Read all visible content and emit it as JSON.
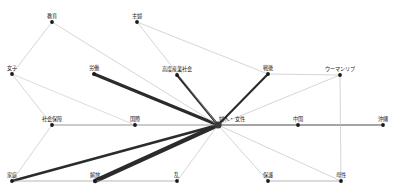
{
  "diagram": {
    "type": "node-link-network",
    "canvas": {
      "width": 400,
      "height": 196,
      "background": "#ffffff"
    },
    "colors": {
      "node_fill": "#1a1a1a",
      "hub_fill": "#3a3a3a",
      "edge_strong": "#2b2b2b",
      "edge_medium": "#6e6e6e",
      "edge_weak": "#b8b8b8",
      "label_color": "#1b1b1b"
    },
    "hub_id": "fujin_josei",
    "nodes": [
      {
        "id": "kyoiku",
        "label": "教育",
        "x": 52,
        "y": 22,
        "r": 1.9,
        "label_dx": 0,
        "label_dy": -3,
        "hub": false
      },
      {
        "id": "shufu",
        "label": "主婦",
        "x": 137,
        "y": 22,
        "r": 1.9,
        "label_dx": 0,
        "label_dy": -3,
        "hub": false
      },
      {
        "id": "joshi",
        "label": "女子",
        "x": 12,
        "y": 74,
        "r": 1.9,
        "label_dx": 0,
        "label_dy": -3,
        "hub": false
      },
      {
        "id": "rodo",
        "label": "労働",
        "x": 94,
        "y": 74,
        "r": 1.9,
        "label_dx": 0,
        "label_dy": -3,
        "hub": false
      },
      {
        "id": "kodosangyo",
        "label": "高度産業社会",
        "x": 177,
        "y": 75,
        "r": 1.9,
        "label_dx": 0,
        "label_dy": -3,
        "hub": false
      },
      {
        "id": "sengo",
        "label": "戦後",
        "x": 268,
        "y": 74,
        "r": 1.9,
        "label_dx": 0,
        "label_dy": -3,
        "hub": false
      },
      {
        "id": "womanlib",
        "label": "ウーマンリブ",
        "x": 340,
        "y": 75,
        "r": 1.9,
        "label_dx": 0,
        "label_dy": -3,
        "hub": false
      },
      {
        "id": "shakaihosho",
        "label": "社会保障",
        "x": 52,
        "y": 125,
        "r": 1.9,
        "label_dx": 0,
        "label_dy": -3,
        "hub": false
      },
      {
        "id": "kokusai",
        "label": "国際",
        "x": 135,
        "y": 125,
        "r": 1.9,
        "label_dx": 0,
        "label_dy": -3,
        "hub": false
      },
      {
        "id": "fujin_josei",
        "label": "婦人・女性",
        "x": 218,
        "y": 125,
        "r": 3.6,
        "label_dx": 14,
        "label_dy": -3,
        "hub": true
      },
      {
        "id": "chugoku",
        "label": "中国",
        "x": 298,
        "y": 125,
        "r": 1.9,
        "label_dx": 0,
        "label_dy": -3,
        "hub": false
      },
      {
        "id": "okinawa",
        "label": "沖縄",
        "x": 383,
        "y": 125,
        "r": 1.9,
        "label_dx": 0,
        "label_dy": -3,
        "hub": false
      },
      {
        "id": "katei",
        "label": "家庭",
        "x": 12,
        "y": 181,
        "r": 1.9,
        "label_dx": 0,
        "label_dy": -3,
        "hub": false
      },
      {
        "id": "kaiho",
        "label": "解放",
        "x": 95,
        "y": 181,
        "r": 1.9,
        "label_dx": 0,
        "label_dy": -3,
        "hub": false
      },
      {
        "id": "ran",
        "label": "乱",
        "x": 177,
        "y": 181,
        "r": 1.9,
        "label_dx": 0,
        "label_dy": -3,
        "hub": false
      },
      {
        "id": "hogo",
        "label": "保護",
        "x": 268,
        "y": 181,
        "r": 1.9,
        "label_dx": 0,
        "label_dy": -3,
        "hub": false
      },
      {
        "id": "bosei",
        "label": "母性",
        "x": 341,
        "y": 181,
        "r": 1.9,
        "label_dx": 0,
        "label_dy": -3,
        "hub": false
      }
    ],
    "edges": [
      {
        "from": "fujin_josei",
        "to": "rodo",
        "weight": 3,
        "color": "#2b2b2b"
      },
      {
        "from": "fujin_josei",
        "to": "kodosangyo",
        "weight": 2.1,
        "color": "#2b2b2b"
      },
      {
        "from": "fujin_josei",
        "to": "sengo",
        "weight": 2.1,
        "color": "#2b2b2b"
      },
      {
        "from": "fujin_josei",
        "to": "katei",
        "weight": 2.6,
        "color": "#2b2b2b"
      },
      {
        "from": "fujin_josei",
        "to": "kaiho",
        "weight": 4.2,
        "color": "#2b2b2b"
      },
      {
        "from": "fujin_josei",
        "to": "kyoiku",
        "weight": 0.6,
        "color": "#b8b8b8"
      },
      {
        "from": "fujin_josei",
        "to": "shufu",
        "weight": 0.6,
        "color": "#b8b8b8"
      },
      {
        "from": "fujin_josei",
        "to": "ran",
        "weight": 0.6,
        "color": "#b8b8b8"
      },
      {
        "from": "fujin_josei",
        "to": "hogo",
        "weight": 0.6,
        "color": "#b8b8b8"
      },
      {
        "from": "fujin_josei",
        "to": "bosei",
        "weight": 0.6,
        "color": "#b8b8b8"
      },
      {
        "from": "fujin_josei",
        "to": "womanlib",
        "weight": 0.6,
        "color": "#b8b8b8"
      },
      {
        "from": "fujin_josei",
        "to": "kokusai",
        "weight": 0.9,
        "color": "#8a8a8a"
      },
      {
        "from": "kokusai",
        "to": "shakaihosho",
        "weight": 0.9,
        "color": "#8a8a8a"
      },
      {
        "from": "fujin_josei",
        "to": "chugoku",
        "weight": 1.1,
        "color": "#4a4a4a"
      },
      {
        "from": "chugoku",
        "to": "okinawa",
        "weight": 1.1,
        "color": "#4a4a4a"
      },
      {
        "from": "kyoiku",
        "to": "joshi",
        "weight": 0.6,
        "color": "#b8b8b8"
      },
      {
        "from": "shufu",
        "to": "sengo",
        "weight": 0.6,
        "color": "#b8b8b8"
      },
      {
        "from": "sengo",
        "to": "womanlib",
        "weight": 0.6,
        "color": "#b8b8b8"
      },
      {
        "from": "joshi",
        "to": "shakaihosho",
        "weight": 0.6,
        "color": "#b8b8b8"
      },
      {
        "from": "joshi",
        "to": "kokusai",
        "weight": 0.6,
        "color": "#c4c4c4"
      },
      {
        "from": "shakaihosho",
        "to": "katei",
        "weight": 0.6,
        "color": "#b8b8b8"
      },
      {
        "from": "katei",
        "to": "kaiho",
        "weight": 0.7,
        "color": "#9a9a9a"
      },
      {
        "from": "kaiho",
        "to": "ran",
        "weight": 0.7,
        "color": "#9a9a9a"
      },
      {
        "from": "hogo",
        "to": "bosei",
        "weight": 0.7,
        "color": "#9a9a9a"
      },
      {
        "from": "womanlib",
        "to": "bosei",
        "weight": 0.6,
        "color": "#b8b8b8"
      }
    ]
  }
}
